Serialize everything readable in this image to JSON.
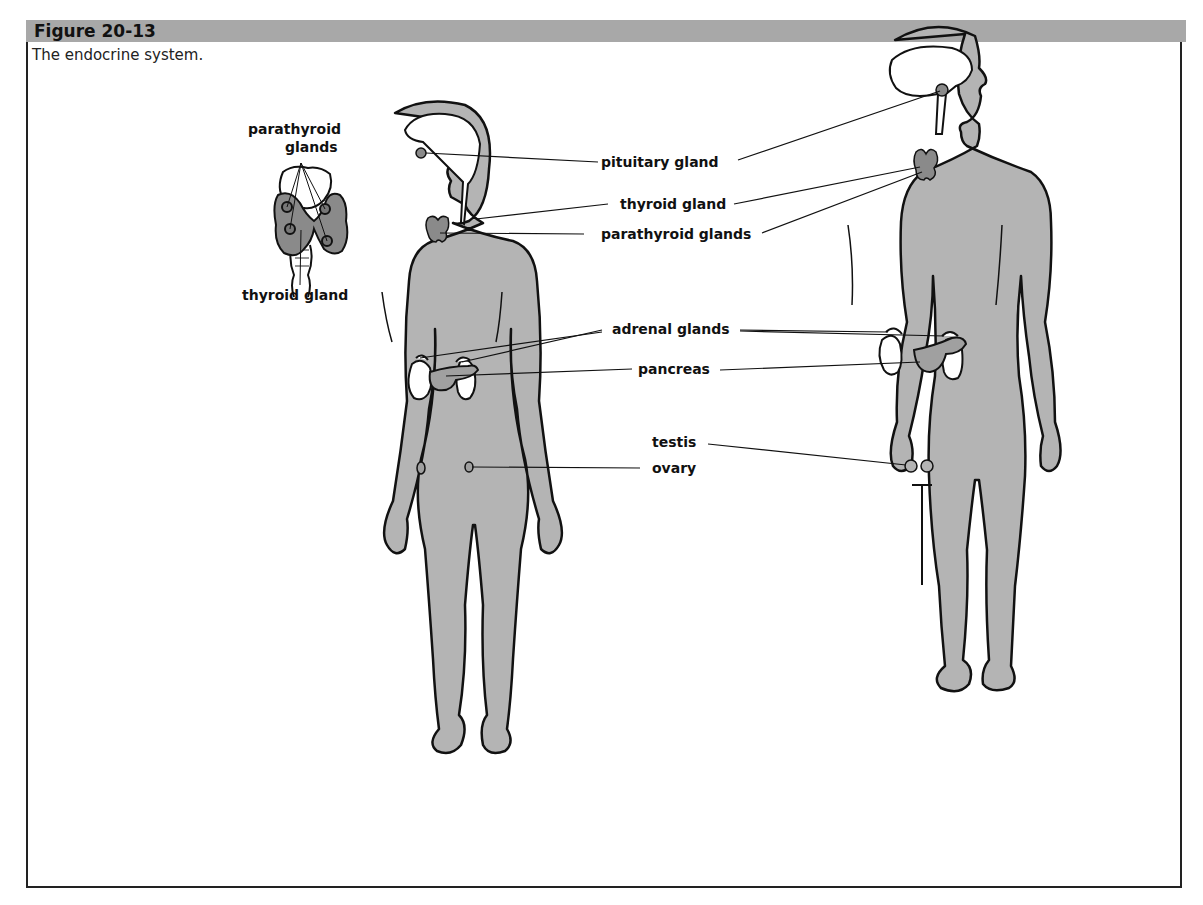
{
  "figure": {
    "number": "Figure 20-13",
    "caption": "The endocrine system."
  },
  "inset": {
    "top_label_line1": "parathyroid",
    "top_label_line2": "glands",
    "bottom_label": "thyroid gland"
  },
  "labels": {
    "pituitary": "pituitary gland",
    "thyroid": "thyroid gland",
    "parathyroid": "parathyroid glands",
    "adrenal": "adrenal glands",
    "pancreas": "pancreas",
    "testis": "testis",
    "ovary": "ovary"
  },
  "figures": [
    "female",
    "male"
  ],
  "colors": {
    "header_bar": "#a8a8a8",
    "body_fill": "#b4b4b4",
    "gland_fill": "#8a8a8a",
    "outline": "#111111"
  }
}
